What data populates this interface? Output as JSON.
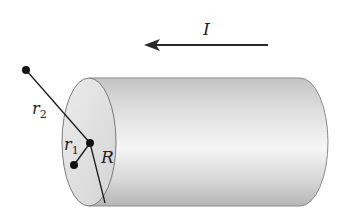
{
  "figure": {
    "labels": {
      "current": "I",
      "radius": "R",
      "r1": "r",
      "r1_sub": "1",
      "r2": "r",
      "r2_sub": "2"
    },
    "current_direction": "left",
    "colors": {
      "line": "#1a1a1a",
      "cylinder_light": "#f4f4f4",
      "cylinder_dark": "#b8b8b8",
      "end_face": "#e2e2e2",
      "background": "#ffffff"
    }
  }
}
